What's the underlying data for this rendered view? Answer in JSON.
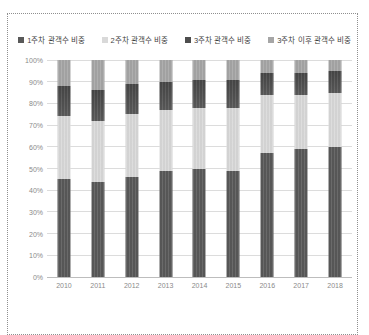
{
  "colors": {
    "s1": "#595959",
    "s2": "#d9d9d9",
    "s3": "#4e4e4e",
    "s4": "#a6a6a6",
    "grid": "#dcdcdc",
    "axis_line": "#bdbdbd",
    "tick_text": "#8a8a8a",
    "legend_text": "#3f3f3f",
    "frame_border": "#8f8f8f",
    "background": "#ffffff"
  },
  "chart_data": {
    "type": "bar",
    "stacked": true,
    "percent_stacked": true,
    "title": "",
    "xlabel": "",
    "ylabel": "",
    "categories": [
      "2010",
      "2011",
      "2012",
      "2013",
      "2014",
      "2015",
      "2016",
      "2017",
      "2018"
    ],
    "series": [
      {
        "name": "1주차 관객수 비중",
        "color_key": "s1",
        "values": [
          45,
          44,
          46,
          49,
          50,
          49,
          57,
          59,
          60
        ]
      },
      {
        "name": "2주차 관객수 비중",
        "color_key": "s2",
        "values": [
          29,
          28,
          29,
          28,
          28,
          29,
          27,
          25,
          25
        ]
      },
      {
        "name": "3주차 관객수 비중",
        "color_key": "s3",
        "values": [
          14,
          14,
          14,
          13,
          13,
          13,
          10,
          10,
          10
        ]
      },
      {
        "name": "3주차 이후 관객수 비중",
        "color_key": "s4",
        "values": [
          12,
          14,
          11,
          10,
          9,
          9,
          6,
          6,
          5
        ]
      }
    ],
    "y_ticks": [
      "100%",
      "90%",
      "80%",
      "70%",
      "60%",
      "50%",
      "40%",
      "30%",
      "20%",
      "10%",
      "0%"
    ],
    "ylim": [
      0,
      100
    ],
    "grid": true,
    "legend_position": "top"
  }
}
